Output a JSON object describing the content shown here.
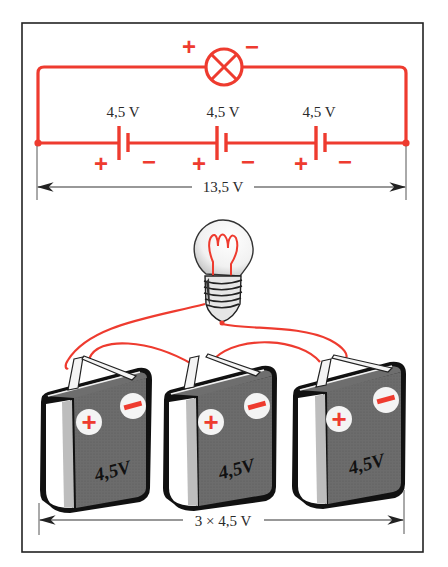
{
  "diagram": {
    "colors": {
      "wire": "#ee3b2f",
      "frame": "#222222",
      "dimension_line": "#333333",
      "battery_body": "#6a6a6a",
      "battery_side": "#d9d9d9",
      "terminal_disc": "#f4f4f4"
    },
    "schematic": {
      "lamp": {
        "symbol": "lamp-cross-circle",
        "plus_label": "+",
        "minus_label": "−"
      },
      "cells": [
        {
          "voltage_label": "4,5 V",
          "plus_label": "+",
          "minus_label": "−"
        },
        {
          "voltage_label": "4,5 V",
          "plus_label": "+",
          "minus_label": "−"
        },
        {
          "voltage_label": "4,5 V",
          "plus_label": "+",
          "minus_label": "−"
        }
      ],
      "total_dimension_label": "13,5 V"
    },
    "illustration": {
      "bulb": "light-bulb",
      "batteries": [
        {
          "label": "4,5V",
          "plus": "+",
          "minus": "−"
        },
        {
          "label": "4,5V",
          "plus": "+",
          "minus": "−"
        },
        {
          "label": "4,5V",
          "plus": "+",
          "minus": "−"
        }
      ],
      "total_dimension_label": "3 × 4,5 V"
    }
  }
}
